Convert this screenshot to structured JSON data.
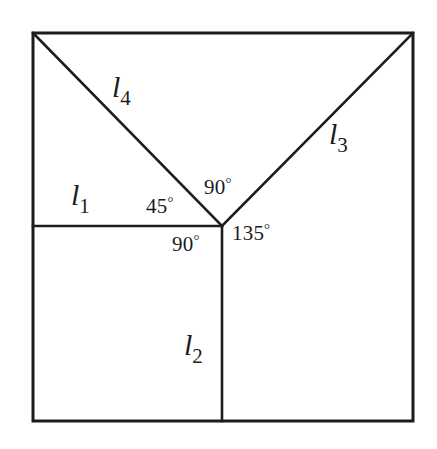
{
  "figure": {
    "type": "geometry-diagram",
    "background_color": "#ffffff",
    "stroke_color": "#1c1c1c",
    "border_color": "#1c1c1c"
  },
  "square": {
    "left": 33,
    "top": 33,
    "right": 413,
    "bottom": 421,
    "stroke_width": 3
  },
  "vertex": {
    "name": "central-vertex",
    "x": 222,
    "y": 226
  },
  "segments": [
    {
      "id": "l1",
      "label": "l",
      "subscript": "1",
      "from": [
        33,
        226
      ],
      "to": [
        222,
        226
      ],
      "orientation": "horizontal",
      "stroke_width": 2.6
    },
    {
      "id": "l2",
      "label": "l",
      "subscript": "2",
      "from": [
        222,
        226
      ],
      "to": [
        222,
        421
      ],
      "orientation": "vertical",
      "stroke_width": 2.6
    },
    {
      "id": "l3",
      "label": "l",
      "subscript": "3",
      "from": [
        222,
        226
      ],
      "to": [
        413,
        33
      ],
      "orientation": "diagonal-up-right",
      "stroke_width": 2.6
    },
    {
      "id": "l4",
      "label": "l",
      "subscript": "4",
      "from": [
        33,
        33
      ],
      "to": [
        222,
        226
      ],
      "orientation": "diagonal-down-right",
      "stroke_width": 2.6
    }
  ],
  "angles": [
    {
      "id": "angle-45",
      "value": "45",
      "degree_symbol": "°",
      "between": [
        "l1",
        "l4"
      ],
      "x": 146,
      "y": 196
    },
    {
      "id": "angle-90-top",
      "value": "90",
      "degree_symbol": "°",
      "between": [
        "l4",
        "l3"
      ],
      "x": 204,
      "y": 177
    },
    {
      "id": "angle-135",
      "value": "135",
      "degree_symbol": "°",
      "between": [
        "l3",
        "l2"
      ],
      "x": 232,
      "y": 223
    },
    {
      "id": "angle-90-bottom",
      "value": "90",
      "degree_symbol": "°",
      "between": [
        "l2",
        "l1"
      ],
      "x": 172,
      "y": 234
    }
  ],
  "labels": {
    "l1": {
      "letter": "l",
      "sub": "1"
    },
    "l2": {
      "letter": "l",
      "sub": "2"
    },
    "l3": {
      "letter": "l",
      "sub": "3"
    },
    "l4": {
      "letter": "l",
      "sub": "4"
    },
    "angle_45": {
      "value": "45",
      "deg": "°"
    },
    "angle_90_top": {
      "value": "90",
      "deg": "°"
    },
    "angle_90_bottom": {
      "value": "90",
      "deg": "°"
    },
    "angle_135": {
      "value": "135",
      "deg": "°"
    }
  }
}
